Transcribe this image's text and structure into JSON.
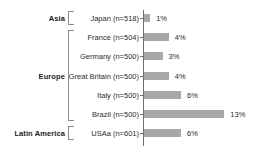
{
  "chart_data": {
    "type": "bar",
    "orientation": "horizontal",
    "title": "",
    "xlabel": "",
    "ylabel": "",
    "xlim": [
      0,
      13
    ],
    "grid": false,
    "legend": null,
    "value_suffix": "%",
    "categories": [
      "Japan (n=518)",
      "France (n=504)",
      "Germany (n=500)",
      "Great Britain (n=500)",
      "Italy (n=500)",
      "Brazil (n=500)",
      "USAa (n=601)"
    ],
    "values": [
      1,
      4,
      3,
      4,
      6,
      13,
      6
    ],
    "value_labels": [
      "1%",
      "4%",
      "3%",
      "4%",
      "6%",
      "13%",
      "6%"
    ],
    "groups": [
      {
        "label": "Asia",
        "start": 0,
        "count": 1
      },
      {
        "label": "Europe",
        "start": 1,
        "count": 5
      },
      {
        "label": "Latin America",
        "start": 6,
        "count": 1
      }
    ],
    "colors": {
      "bar": "#a8a8a8",
      "axis": "#6f6f6f",
      "bracket": "#8d8d8d",
      "text": "#2a2a2a",
      "group_text": "#1b1b1b",
      "background": "#ffffff"
    }
  }
}
